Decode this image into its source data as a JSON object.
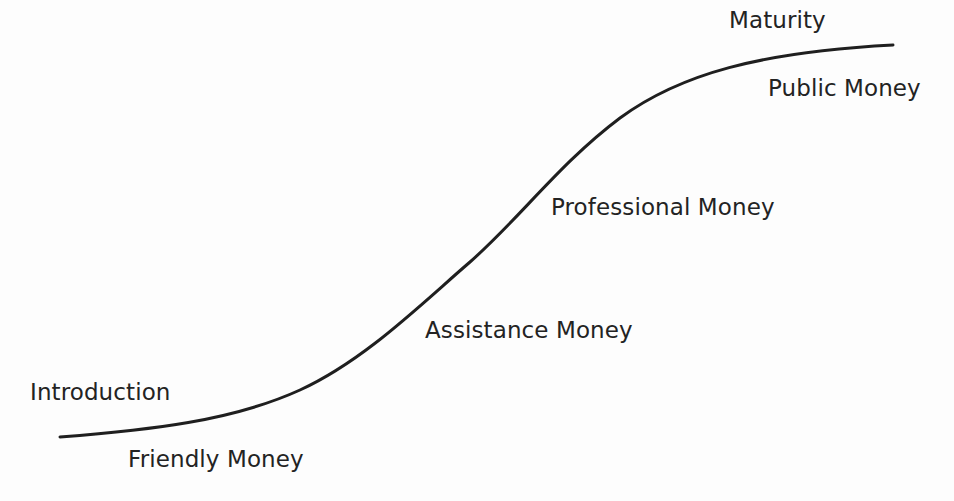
{
  "diagram": {
    "type": "s-curve-lifecycle",
    "background_color": "#fdfdfd",
    "curve": {
      "name": "adoption-s-curve",
      "stroke_color": "#1f1f1f",
      "stroke_width": 3,
      "start_point": {
        "x": 60,
        "y": 437
      },
      "end_point": {
        "x": 893,
        "y": 45
      },
      "inflection_point": {
        "x": 505,
        "y": 241
      },
      "path": "M 60 437 C 150 430, 232 421, 300 390 C 365 360, 420 305, 470 262 C 520 218, 560 163, 620 118 C 680 74, 760 52, 893 45"
    },
    "labels": [
      {
        "id": "introduction",
        "text": "Introduction",
        "x": 30,
        "y": 381,
        "role": "phase"
      },
      {
        "id": "friendly-money",
        "text": "Friendly Money",
        "x": 128,
        "y": 448,
        "role": "funding-source"
      },
      {
        "id": "assistance-money",
        "text": "Assistance Money",
        "x": 425,
        "y": 319,
        "role": "funding-source"
      },
      {
        "id": "professional-money",
        "text": "Professional Money",
        "x": 551,
        "y": 196,
        "role": "funding-source"
      },
      {
        "id": "maturity",
        "text": "Maturity",
        "x": 729,
        "y": 9,
        "role": "phase"
      },
      {
        "id": "public-money",
        "text": "Public Money",
        "x": 768,
        "y": 77,
        "role": "funding-source"
      }
    ]
  },
  "chart_data": {
    "type": "line",
    "xlabel": "",
    "ylabel": "",
    "grid": false,
    "legend": "none",
    "x": [
      0,
      10,
      20,
      30,
      40,
      50,
      60,
      70,
      80,
      90,
      100
    ],
    "series": [
      {
        "name": "Adoption / Growth",
        "values": [
          2,
          4,
          7,
          13,
          24,
          42,
          62,
          78,
          88,
          94,
          97
        ]
      }
    ],
    "annotations": [
      {
        "text": "Introduction",
        "stage": "start"
      },
      {
        "text": "Friendly Money",
        "stage": "start"
      },
      {
        "text": "Assistance Money",
        "stage": "early-growth"
      },
      {
        "text": "Professional Money",
        "stage": "rapid-growth"
      },
      {
        "text": "Maturity",
        "stage": "end"
      },
      {
        "text": "Public Money",
        "stage": "end"
      }
    ]
  }
}
